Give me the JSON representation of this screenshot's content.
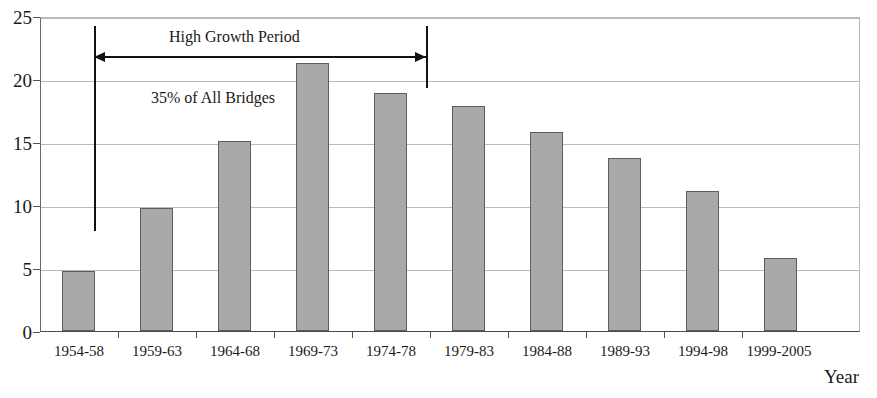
{
  "chart_data": {
    "type": "bar",
    "title": "",
    "subtitle": "",
    "xlabel": "Year",
    "ylabel": "",
    "categories": [
      "1954-58",
      "1959-63",
      "1964-68",
      "1969-73",
      "1974-78",
      "1979-83",
      "1984-88",
      "1989-93",
      "1994-98",
      "1999-2005"
    ],
    "values": [
      4.8,
      9.8,
      15.2,
      21.4,
      19.0,
      18.0,
      15.9,
      13.8,
      11.2,
      5.8
    ],
    "ylim": [
      0,
      25
    ],
    "ytick_labels": [
      "0",
      "5",
      "10",
      "15",
      "20",
      "25"
    ],
    "ytick_values": [
      0,
      5,
      10,
      15,
      20,
      25
    ],
    "grid": true,
    "legend": "none",
    "bar_color": "#a9a9a9",
    "bar_edge_color": "#5d5d5d",
    "annotations": [
      {
        "id": "high-growth-period",
        "text": "High Growth Period",
        "kind": "span-label",
        "span_start_category": "1954-58",
        "span_end_category": "1974-78"
      },
      {
        "id": "share-of-all-bridges",
        "text": "35% of All Bridges",
        "kind": "span-label",
        "span_start_category": "1954-58",
        "span_end_category": "1974-78"
      }
    ]
  },
  "axis_title": {
    "x": "Year"
  }
}
